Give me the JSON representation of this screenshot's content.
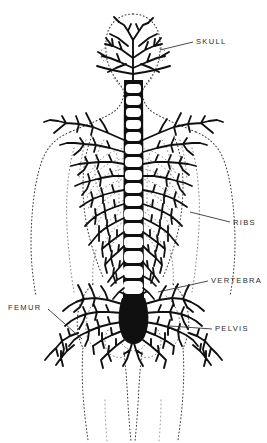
{
  "figure": {
    "kind": "anatomical-illustration",
    "background_color": "#ffffff",
    "ink_color": "#101010",
    "outline_color": "#3a3a3a",
    "label_color": "#2b2b2b",
    "width": 267,
    "height": 443
  },
  "labels": [
    {
      "id": "skull",
      "text": "SKULL",
      "x": 196,
      "y": 38,
      "leader": {
        "x1": 193,
        "y1": 42,
        "x2": 160,
        "y2": 50
      }
    },
    {
      "id": "ribs",
      "text": "RIBS",
      "x": 233,
      "y": 219,
      "leader": {
        "x1": 230,
        "y1": 222,
        "x2": 190,
        "y2": 212
      }
    },
    {
      "id": "vertebra",
      "text": "VERTEBRA",
      "x": 211,
      "y": 277,
      "leader": {
        "x1": 208,
        "y1": 281,
        "x2": 158,
        "y2": 292
      }
    },
    {
      "id": "femur",
      "text": "FEMUR",
      "x": 8,
      "y": 304,
      "leader": {
        "x1": 48,
        "y1": 309,
        "x2": 82,
        "y2": 339
      }
    },
    {
      "id": "pelvis",
      "text": "PELVIS",
      "x": 215,
      "y": 325,
      "leader": {
        "x1": 212,
        "y1": 329,
        "x2": 170,
        "y2": 326
      }
    }
  ],
  "structures": [
    {
      "id": "skull",
      "name": "Skull",
      "note": "dendritic uptake mass at head"
    },
    {
      "id": "spine",
      "name": "Vertebral column",
      "note": "ladder of vertebral bodies"
    },
    {
      "id": "ribs",
      "name": "Ribs",
      "note": "branching costal uptake"
    },
    {
      "id": "pelvis",
      "name": "Pelvis",
      "note": "dense dendritic mass"
    },
    {
      "id": "femur",
      "name": "Femur",
      "note": "proximal femoral uptake"
    },
    {
      "id": "body-outline",
      "name": "Body outline",
      "note": "dotted silhouette"
    }
  ]
}
